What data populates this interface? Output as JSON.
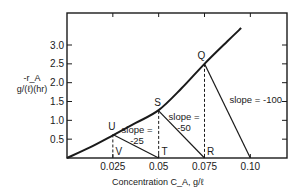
{
  "chart_data": {
    "type": "line",
    "title": "",
    "xlabel": "Concentration C_A, g/ℓ",
    "ylabel_line1": "-r_A",
    "ylabel_line2": "g/(ℓ)(hr)",
    "xlim": [
      0,
      0.12
    ],
    "ylim": [
      0,
      3.85
    ],
    "x_ticks": [
      0.025,
      0.05,
      0.075,
      0.1
    ],
    "x_tick_labels": [
      "0.025",
      "0.05",
      "0.075",
      "0.10"
    ],
    "y_ticks": [
      0.5,
      1.0,
      1.5,
      2.0,
      2.5,
      3.0
    ],
    "y_tick_labels": [
      "0.5",
      "1.0",
      "1.5",
      "2.0",
      "2.5",
      "3.0"
    ],
    "grid": false,
    "series": [
      {
        "name": "rate curve",
        "x": [
          0,
          0.0125,
          0.025,
          0.0375,
          0.05,
          0.0625,
          0.075,
          0.0875,
          0.095
        ],
        "y": [
          0,
          0.28,
          0.6,
          0.93,
          1.27,
          1.85,
          2.5,
          3.1,
          3.45
        ]
      }
    ],
    "points": [
      {
        "label": "U",
        "x": 0.025,
        "y": 0.625
      },
      {
        "label": "S",
        "x": 0.05,
        "y": 1.25
      },
      {
        "label": "Q",
        "x": 0.075,
        "y": 2.5
      },
      {
        "label": "V",
        "x": 0.025,
        "y": 0
      },
      {
        "label": "T",
        "x": 0.05,
        "y": 0
      },
      {
        "label": "R",
        "x": 0.075,
        "y": 0
      }
    ],
    "tangent_lines": [
      {
        "from": "U",
        "to_x": 0.05,
        "slope": -25,
        "label": "slope =\n-25"
      },
      {
        "from": "S",
        "to_x": 0.075,
        "slope": -50,
        "label": "slope =\n-50"
      },
      {
        "from": "Q",
        "to_x": 0.1,
        "slope": -100,
        "label": "slope = -100"
      }
    ],
    "annotations": [
      "slope = -25",
      "slope = -50",
      "slope = -100"
    ]
  }
}
